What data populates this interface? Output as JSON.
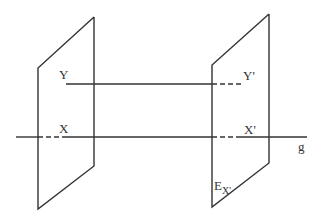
{
  "diagram": {
    "type": "geometry-planes-and-lines",
    "colors": {
      "stroke": "#333333",
      "background": "#ffffff",
      "text": "#333333"
    },
    "labels": {
      "Y": "Y",
      "Y_prime": "Y'",
      "X": "X",
      "X_prime": "X'",
      "g": "g",
      "E_base": "E",
      "E_sub": "X'"
    },
    "planes": [
      {
        "name": "left-plane",
        "points": [
          [
            94,
            17
          ],
          [
            94,
            166
          ],
          [
            38,
            209
          ],
          [
            38,
            68
          ]
        ]
      },
      {
        "name": "right-plane",
        "points": [
          [
            269,
            14
          ],
          [
            269,
            163
          ],
          [
            212,
            207
          ],
          [
            212,
            65
          ]
        ]
      }
    ],
    "lines": {
      "line_y": {
        "solid": [
          [
            66,
            84
          ],
          [
            212,
            84
          ]
        ],
        "dashed": [
          [
            212,
            84
          ],
          [
            241,
            84
          ]
        ]
      },
      "line_g": {
        "solid_left": [
          [
            16,
            137
          ],
          [
            38,
            137
          ]
        ],
        "dashed_left": [
          [
            38,
            137
          ],
          [
            64,
            137
          ]
        ],
        "solid_mid": [
          [
            64,
            137
          ],
          [
            212,
            137
          ]
        ],
        "dashed_right": [
          [
            212,
            137
          ],
          [
            241,
            137
          ]
        ],
        "solid_right": [
          [
            241,
            137
          ],
          [
            307,
            137
          ]
        ]
      }
    }
  }
}
